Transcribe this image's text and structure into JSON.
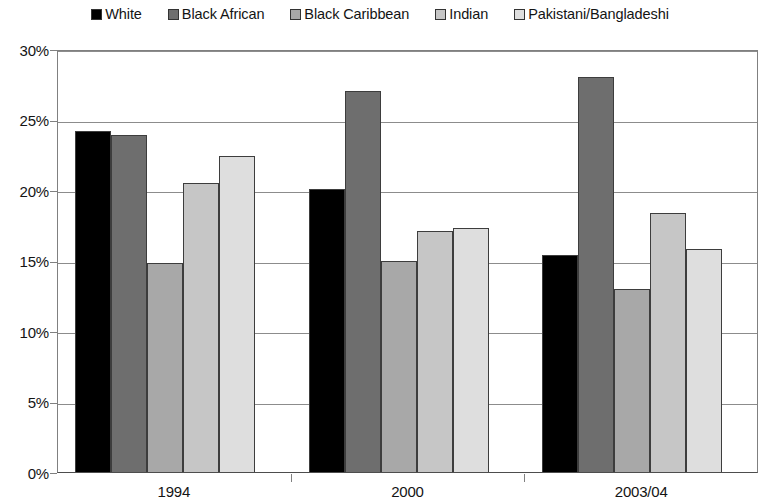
{
  "legend": {
    "position": "top-center",
    "items": [
      {
        "label": "White",
        "color": "#000000",
        "icon": "square-swatch-icon"
      },
      {
        "label": "Black African",
        "color": "#6e6e6e",
        "icon": "square-swatch-icon"
      },
      {
        "label": "Black Caribbean",
        "color": "#a8a8a8",
        "icon": "square-swatch-icon"
      },
      {
        "label": "Indian",
        "color": "#c6c6c6",
        "icon": "square-swatch-icon"
      },
      {
        "label": "Pakistani/Bangladeshi",
        "color": "#dedede",
        "icon": "square-swatch-icon"
      }
    ]
  },
  "axes": {
    "y_ticks": [
      "0%",
      "5%",
      "10%",
      "15%",
      "20%",
      "25%",
      "30%"
    ],
    "y_values": [
      0,
      5,
      10,
      15,
      20,
      25,
      30
    ],
    "x_ticks": [
      "1994",
      "2000",
      "2003/04"
    ]
  },
  "chart_data": {
    "type": "bar",
    "title": "",
    "subtitle": "",
    "xlabel": "",
    "ylabel": "",
    "ylim": [
      0,
      30
    ],
    "ytick_format": "percent",
    "yticks": [
      0,
      5,
      10,
      15,
      20,
      25,
      30
    ],
    "grid": true,
    "legend_position": "top-center",
    "categories": [
      "1994",
      "2000",
      "2003/04"
    ],
    "series": [
      {
        "name": "White",
        "color": "#000000",
        "values": [
          24.2,
          20.1,
          15.4
        ]
      },
      {
        "name": "Black African",
        "color": "#6e6e6e",
        "values": [
          23.9,
          27.0,
          28.0
        ]
      },
      {
        "name": "Black Caribbean",
        "color": "#a8a8a8",
        "values": [
          14.8,
          15.0,
          13.0
        ]
      },
      {
        "name": "Indian",
        "color": "#c6c6c6",
        "values": [
          20.5,
          17.1,
          18.4
        ]
      },
      {
        "name": "Pakistani/Bangladeshi",
        "color": "#dedede",
        "values": [
          22.4,
          17.3,
          15.8
        ]
      }
    ]
  }
}
